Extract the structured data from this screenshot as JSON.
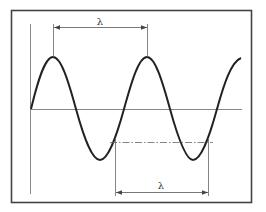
{
  "diagram": {
    "type": "sine-wave-wavelength",
    "labels": {
      "top_wavelength": "λ",
      "bottom_wavelength": "λ"
    },
    "colors": {
      "frame": "#444444",
      "wave": "#222222",
      "axes": "#777777",
      "dimension": "#555555"
    },
    "description": {
      "top_dimension": "peak-to-peak wavelength",
      "bottom_dimension": "wavelength measured between successive crossings of a reference level"
    }
  }
}
